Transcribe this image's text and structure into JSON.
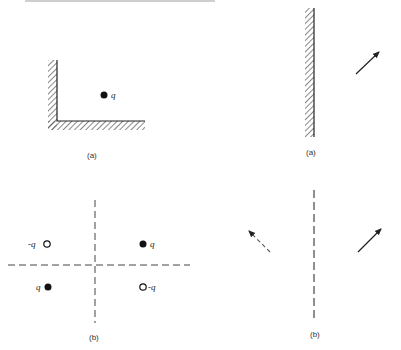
{
  "figure": {
    "top_text_fragment": "",
    "panels": {
      "left_a": {
        "caption": "(a)",
        "description": "Point charge near L-shaped grounded conducting corner",
        "charge_label": "q"
      },
      "left_b": {
        "caption": "(b)",
        "description": "Image charges for corner: two real q and two image -q with dashed symmetry axes",
        "charges": [
          {
            "label": "-q",
            "type": "open",
            "quadrant": "upper-left"
          },
          {
            "label": "q",
            "type": "filled",
            "quadrant": "upper-right"
          },
          {
            "label": "q",
            "type": "filled",
            "quadrant": "lower-left"
          },
          {
            "label": "-q",
            "type": "open",
            "quadrant": "lower-right"
          }
        ]
      },
      "right_a": {
        "caption": "(a)",
        "description": "Dipole/vector near a planar conducting wall"
      },
      "right_b": {
        "caption": "(b)",
        "description": "Image of vector across dashed plane: solid arrow and dashed mirror arrow"
      }
    },
    "colors": {
      "ink": "#222222",
      "hatch": "#555555",
      "dashed": "#444444"
    }
  }
}
